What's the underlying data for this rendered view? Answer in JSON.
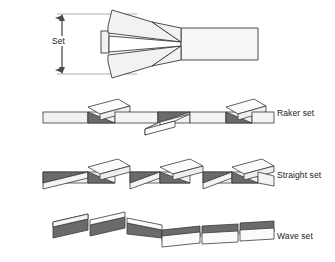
{
  "figure": {
    "type": "technical-diagram",
    "background_color": "#ffffff",
    "line_color": "#3a3a3a",
    "fill_light": "#f2f2f2",
    "fill_mid": "#d9d9d9",
    "fill_dark": "#6b6b6b"
  },
  "dimension": {
    "label": "Set",
    "arrow_style": "double-ended",
    "orientation": "vertical"
  },
  "rows": [
    {
      "id": "detail",
      "label": "",
      "description": "Enlarged end view of two teeth splayed apart forming a V, with blade body to the right"
    },
    {
      "id": "raker",
      "label": "Raker set",
      "description": "Repeating group of one left-set tooth, one right-set tooth, and one unset raker tooth",
      "tooth_count": 3
    },
    {
      "id": "straight",
      "label": "Straight set",
      "description": "Teeth alternate strictly left and right, one after another",
      "tooth_count": 6
    },
    {
      "id": "wave",
      "label": "Wave set",
      "description": "Groups of teeth bend gradually to one side then gradually to the other, forming a wave",
      "tooth_count": 6
    }
  ],
  "labels": {
    "set": "Set",
    "raker": "Raker set",
    "straight": "Straight set",
    "wave": "Wave set"
  }
}
